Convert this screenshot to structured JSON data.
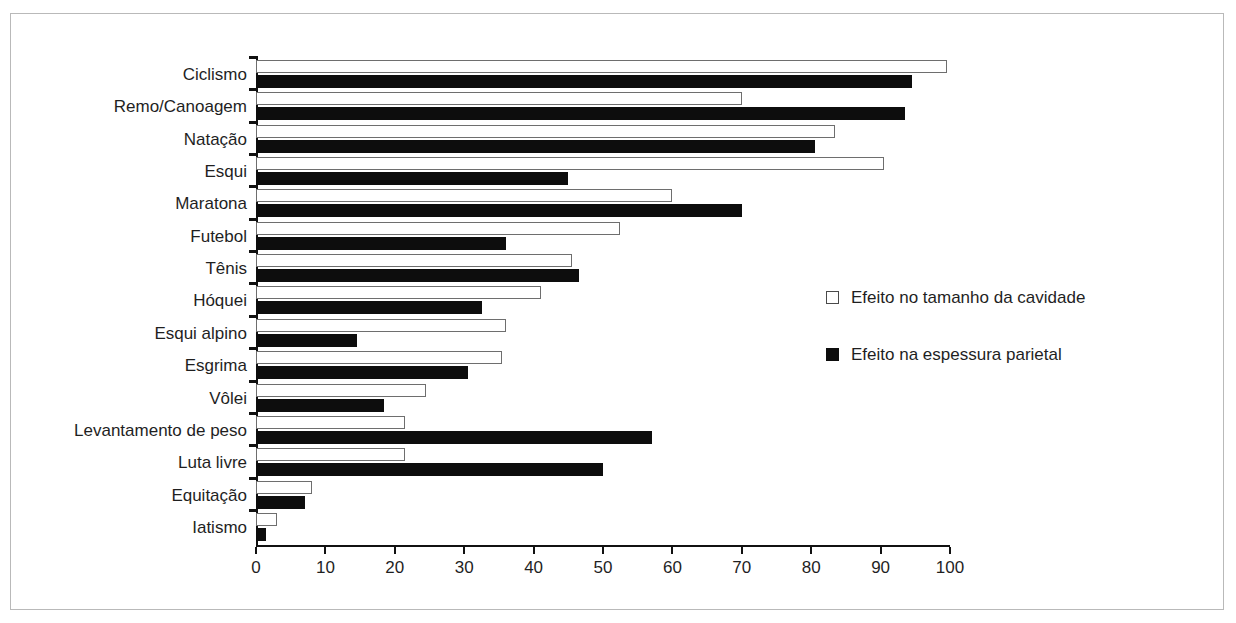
{
  "chart_data": {
    "type": "bar",
    "orientation": "horizontal",
    "title": "",
    "subtitle": "",
    "xlabel": "",
    "ylabel": "",
    "xlim": [
      0,
      100
    ],
    "xticks": [
      "0",
      "10",
      "20",
      "30",
      "40",
      "50",
      "60",
      "70",
      "80",
      "90",
      "100"
    ],
    "grid": false,
    "legend_position": "right-middle",
    "categories": [
      "Ciclismo",
      "Remo/Canoagem",
      "Natação",
      "Esqui",
      "Maratona",
      "Futebol",
      "Tênis",
      "Hóquei",
      "Esqui alpino",
      "Esgrima",
      "Vôlei",
      "Levantamento de peso",
      "Luta livre",
      "Equitação",
      "Iatismo"
    ],
    "series": [
      {
        "name": "Efeito no tamanho da cavidade",
        "swatch": "cavity",
        "color": "#ffffff",
        "edge_color": "#6e6e6e",
        "values": [
          99.5,
          70.0,
          83.5,
          90.5,
          60.0,
          52.5,
          45.5,
          41.0,
          36.0,
          35.5,
          24.5,
          21.5,
          21.5,
          8.0,
          3.0
        ]
      },
      {
        "name": "Efeito na espessura parietal",
        "swatch": "wall",
        "color": "#0d0d0d",
        "edge_color": "#0d0d0d",
        "values": [
          94.5,
          93.5,
          80.5,
          45.0,
          70.0,
          36.0,
          46.5,
          32.5,
          14.5,
          30.5,
          18.5,
          57.0,
          50.0,
          7.0,
          1.5
        ]
      }
    ]
  },
  "legend": {
    "entries": [
      {
        "label": "Efeito no tamanho da cavidade",
        "swatch": "cavity"
      },
      {
        "label": "Efeito na espessura parietal",
        "swatch": "wall"
      }
    ]
  },
  "colors": {
    "frame": "#b9b9b9",
    "axis": "#111111",
    "text": "#1f1f1f",
    "bar_filled": "#0d0d0d",
    "bar_hollow_edge": "#6e6e6e",
    "background": "#ffffff"
  }
}
